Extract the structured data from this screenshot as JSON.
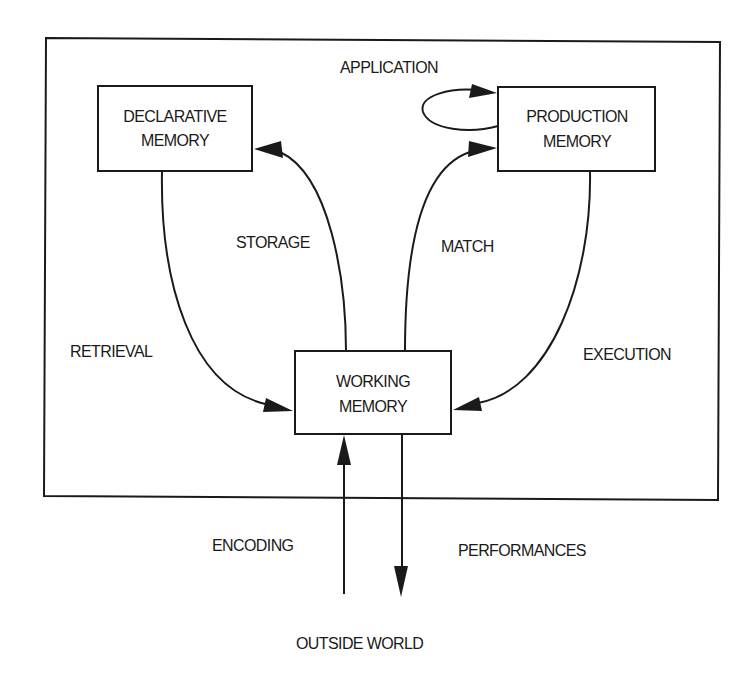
{
  "diagram": {
    "type": "flow-diagram",
    "nodes": {
      "declarative": {
        "line1": "DECLARATIVE",
        "line2": "MEMORY"
      },
      "production": {
        "line1": "PRODUCTION",
        "line2": "MEMORY"
      },
      "working": {
        "line1": "WORKING",
        "line2": "MEMORY"
      },
      "outside": {
        "label": "OUTSIDE WORLD"
      }
    },
    "edges": {
      "application": {
        "label": "APPLICATION",
        "from": "production",
        "to": "production"
      },
      "storage": {
        "label": "STORAGE",
        "from": "working",
        "to": "declarative"
      },
      "match": {
        "label": "MATCH",
        "from": "working",
        "to": "production"
      },
      "retrieval": {
        "label": "RETRIEVAL",
        "from": "declarative",
        "to": "working"
      },
      "execution": {
        "label": "EXECUTION",
        "from": "production",
        "to": "working"
      },
      "encoding": {
        "label": "ENCODING",
        "from": "outside",
        "to": "working"
      },
      "performances": {
        "label": "PERFORMANCES",
        "from": "working",
        "to": "outside"
      }
    },
    "colors": {
      "ink": "#1a1a1a",
      "background": "#ffffff"
    }
  }
}
